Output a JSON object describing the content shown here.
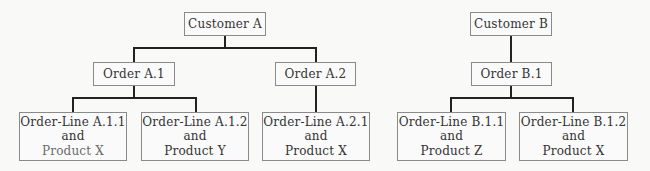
{
  "diagram": {
    "type": "hierarchy",
    "trees": [
      {
        "customer": "Customer A",
        "orders": [
          {
            "label": "Order A.1",
            "order_lines": [
              {
                "line1": "Order-Line A.1.1",
                "line2": "and",
                "line3": "Product X"
              },
              {
                "line1": "Order-Line A.1.2",
                "line2": "and",
                "line3": "Product Y"
              }
            ]
          },
          {
            "label": "Order A.2",
            "order_lines": [
              {
                "line1": "Order-Line A.2.1",
                "line2": "and",
                "line3": "Product X"
              }
            ]
          }
        ]
      },
      {
        "customer": "Customer B",
        "orders": [
          {
            "label": "Order B.1",
            "order_lines": [
              {
                "line1": "Order-Line B.1.1",
                "line2": "and",
                "line3": "Product Z"
              },
              {
                "line1": "Order-Line B.1.2",
                "line2": "and",
                "line3": "Product X"
              }
            ]
          }
        ]
      }
    ]
  }
}
